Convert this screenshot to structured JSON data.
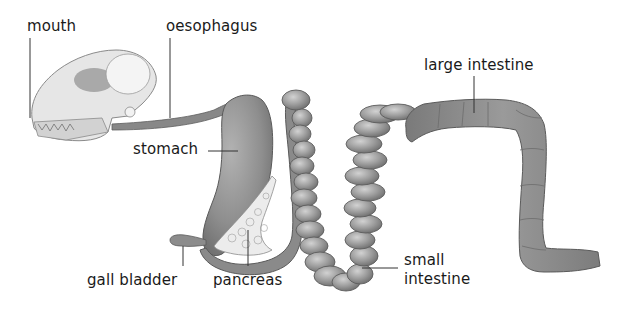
{
  "diagram": {
    "colors": {
      "background": "#ffffff",
      "organ_fill": "#8e8e8e",
      "organ_dark": "#5e5e5e",
      "organ_light": "#bdbdbd",
      "skull_fill": "#e4e4e4",
      "pancreas_fill": "#e8e8e8",
      "label_text": "#1a1a1a",
      "leader_line": "#333333"
    },
    "labels": {
      "mouth": "mouth",
      "oesophagus": "oesophagus",
      "stomach": "stomach",
      "gall_bladder": "gall bladder",
      "pancreas": "pancreas",
      "small_intestine_line1": "small",
      "small_intestine_line2": "intestine",
      "large_intestine": "large intestine"
    }
  }
}
